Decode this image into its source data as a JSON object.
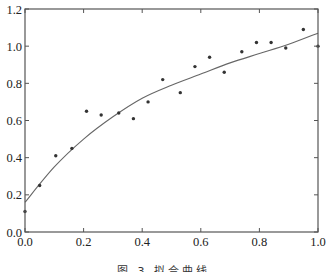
{
  "chart_data": {
    "type": "scatter",
    "title": "",
    "xlabel": "",
    "ylabel": "",
    "xlim": [
      0.0,
      1.0
    ],
    "ylim": [
      0.0,
      1.2
    ],
    "grid": false,
    "legend": null,
    "x_ticks": [
      "0.0",
      "0.2",
      "0.4",
      "0.6",
      "0.8",
      "1.0"
    ],
    "y_ticks": [
      "0.0",
      "0.2",
      "0.4",
      "0.6",
      "0.8",
      "1.0",
      "1.2"
    ],
    "series": [
      {
        "name": "observations",
        "kind": "scatter",
        "x": [
          0.0,
          0.05,
          0.105,
          0.16,
          0.21,
          0.26,
          0.32,
          0.37,
          0.42,
          0.47,
          0.53,
          0.58,
          0.63,
          0.68,
          0.74,
          0.79,
          0.84,
          0.89,
          0.95,
          1.0
        ],
        "y": [
          0.11,
          0.25,
          0.41,
          0.45,
          0.65,
          0.63,
          0.64,
          0.61,
          0.7,
          0.82,
          0.75,
          0.89,
          0.94,
          0.86,
          0.97,
          1.02,
          1.02,
          0.99,
          1.09,
          1.0
        ]
      },
      {
        "name": "fitted curve",
        "kind": "line",
        "x": [
          0.0,
          0.1,
          0.2,
          0.3,
          0.4,
          0.5,
          0.6,
          0.7,
          0.8,
          0.9,
          1.0
        ],
        "y": [
          0.16,
          0.35,
          0.5,
          0.62,
          0.72,
          0.79,
          0.85,
          0.91,
          0.96,
          1.01,
          1.07
        ]
      }
    ]
  },
  "caption": "图 3   拟合曲线"
}
